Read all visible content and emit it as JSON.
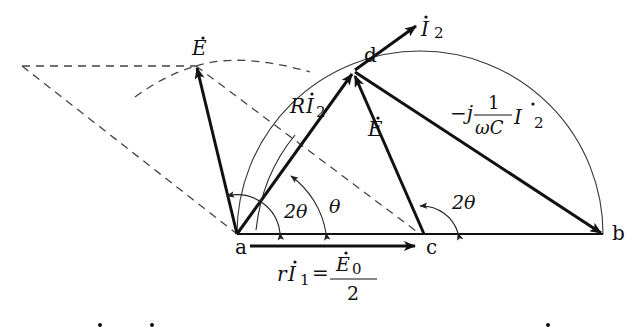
{
  "diagram": {
    "type": "phasor-diagram",
    "points": {
      "a": "a",
      "b": "b",
      "c": "c",
      "d": "d"
    },
    "labels": {
      "E_dot": "E",
      "E_dot_center": "E",
      "I2": "I",
      "I2_sub": "2",
      "R_I2_R": "R",
      "R_I2_I": "I",
      "R_I2_sub": "2",
      "cap_minus_j": "−j",
      "cap_num": "1",
      "cap_den": "ωC",
      "cap_I": "I",
      "cap_sub": "2",
      "angle_2theta_a": "2θ",
      "angle_theta": "θ",
      "angle_2theta_c": "2θ",
      "rI1_r": "r",
      "rI1_I": "I",
      "rI1_sub": "1",
      "rI1_eq": "=",
      "E0": "E",
      "E0_sub": "0",
      "E0_den": "2"
    },
    "colors": {
      "stroke": "#111111",
      "thin": "#333333",
      "dashed": "#444444"
    }
  }
}
